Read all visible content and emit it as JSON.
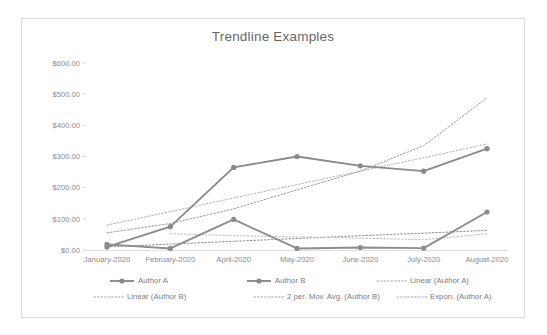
{
  "chart_data": {
    "type": "line",
    "title": "Trendline Examples",
    "xlabel": "",
    "ylabel": "",
    "grid": false,
    "legend_position": "bottom",
    "categories": [
      "January-2020",
      "February-2020",
      "April-2020",
      "May-2020",
      "June-2020",
      "July-2020",
      "August-2020"
    ],
    "ylim": [
      0,
      600
    ],
    "ytick_labels": [
      "$600.00",
      "$500.00",
      "$400.00",
      "$300.00",
      "$200.00",
      "$100.00",
      "$0.00"
    ],
    "ytick_values": [
      600,
      500,
      400,
      300,
      200,
      100,
      0
    ],
    "series": [
      {
        "name": "Author A",
        "style": "solid",
        "marker": "circle",
        "color": "#8a8a8a",
        "values": [
          10,
          75,
          265,
          300,
          270,
          253,
          325
        ]
      },
      {
        "name": "Author B",
        "style": "solid",
        "marker": "circle",
        "color": "#8d8d8d",
        "values": [
          18,
          5,
          98,
          5,
          8,
          6,
          122
        ]
      },
      {
        "name": "Linear (Author A)",
        "style": "dotted",
        "marker": "none",
        "color": "#b4b4b4",
        "values": [
          80,
          123,
          167,
          210,
          253,
          296,
          340
        ]
      },
      {
        "name": "Linear (Author B)",
        "style": "dotted",
        "marker": "none",
        "color": "#8f8f8f",
        "values": [
          10,
          19,
          28,
          37,
          46,
          54,
          63
        ]
      },
      {
        "name": "2 per. Mov. Avg. (Author B)",
        "style": "dotted",
        "marker": "none",
        "values": [
          null,
          52,
          46,
          42,
          38,
          33,
          52
        ],
        "color": "#bdbdbd"
      },
      {
        "name": "Expon. (Author A)",
        "style": "dotted",
        "marker": "none",
        "color": "#9a9a9a",
        "values": [
          55,
          85,
          132,
          193,
          253,
          335,
          488
        ]
      }
    ],
    "legend": [
      {
        "label": "Author A",
        "style": "solid-marker"
      },
      {
        "label": "Author B",
        "style": "solid-marker"
      },
      {
        "label": "Linear (Author A)",
        "style": "dotted"
      },
      {
        "label": "Linear (Author B)",
        "style": "dotted"
      },
      {
        "label": "2 per. Mov. Avg. (Author B)",
        "style": "dotted"
      },
      {
        "label": "Expon. (Author A)",
        "style": "dotted"
      }
    ],
    "colors": {
      "title": "#676767",
      "tick_label": "#8a8a8a",
      "legend_label": "#7d7d7d",
      "frame": "#d9dada",
      "axis": "#d4d4d4",
      "background": "#ffffff"
    }
  }
}
